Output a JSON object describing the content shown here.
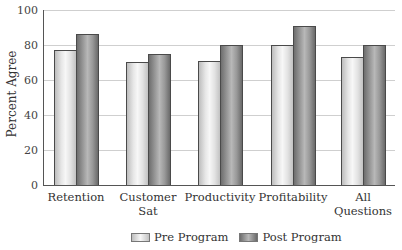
{
  "chart_data": {
    "type": "bar",
    "title": "",
    "xlabel": "",
    "ylabel": "Percent Agree",
    "ylim": [
      0,
      100
    ],
    "yticks": [
      0,
      20,
      40,
      60,
      80,
      100
    ],
    "grid": true,
    "legend_position": "bottom",
    "categories": [
      "Retention",
      "Customer Sat",
      "Productivity",
      "Profitability",
      "All Questions"
    ],
    "category_labels": [
      [
        "Retention"
      ],
      [
        "Customer",
        "Sat"
      ],
      [
        "Productivity"
      ],
      [
        "Profitability"
      ],
      [
        "All",
        "Questions"
      ]
    ],
    "series": [
      {
        "name": "Pre Program",
        "values": [
          77,
          70,
          71,
          80,
          73
        ],
        "color": "#e6e6e6"
      },
      {
        "name": "Post Program",
        "values": [
          86,
          75,
          80,
          91,
          80
        ],
        "color": "#9a9a9a"
      }
    ]
  },
  "legend": {
    "pre_label": "Pre Program",
    "post_label": "Post Program"
  },
  "axis": {
    "ylabel": "Percent Agree",
    "ticks": [
      "0",
      "20",
      "40",
      "60",
      "80",
      "100"
    ]
  }
}
